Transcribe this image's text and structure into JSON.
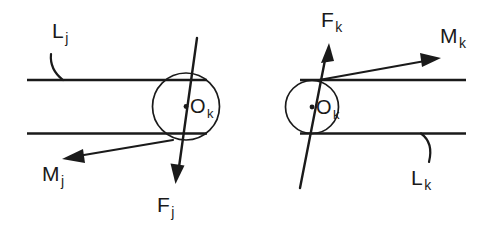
{
  "figure": {
    "background_color": "#ffffff",
    "stroke_color": "#1a1a1a",
    "width": 491,
    "height": 239
  },
  "left_diagram": {
    "name": "link-j-diagram",
    "labels": {
      "link": {
        "base": "L",
        "sub": "j"
      },
      "joint": {
        "base": "O",
        "sub": "k"
      },
      "moment": {
        "base": "M",
        "sub": "j"
      },
      "force": {
        "base": "F",
        "sub": "j"
      }
    }
  },
  "right_diagram": {
    "name": "link-k-diagram",
    "labels": {
      "link": {
        "base": "L",
        "sub": "k"
      },
      "joint": {
        "base": "O",
        "sub": "k"
      },
      "moment": {
        "base": "M",
        "sub": "k"
      },
      "force": {
        "base": "F",
        "sub": "k"
      }
    }
  }
}
